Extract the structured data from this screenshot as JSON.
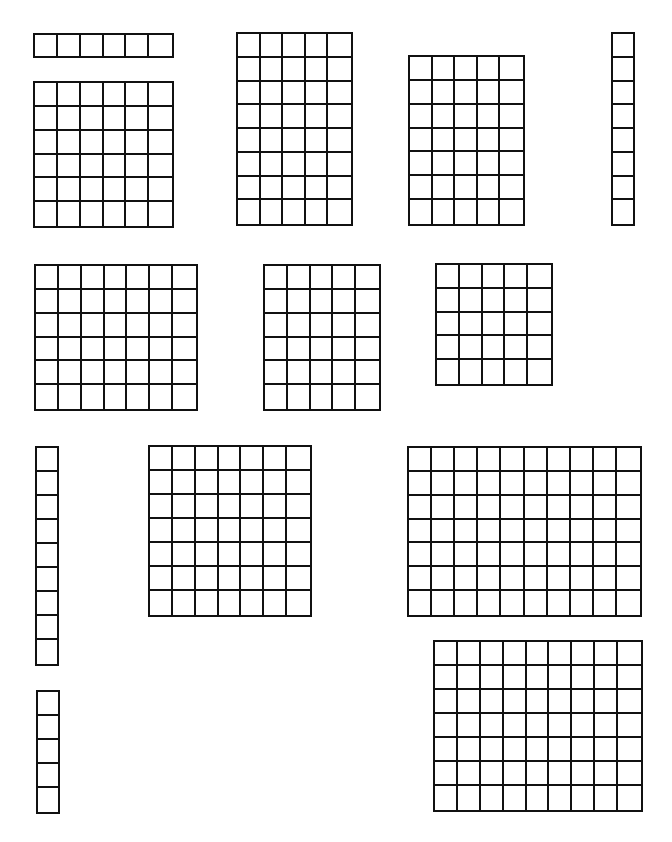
{
  "page": {
    "background": "#ffffff",
    "line_color": "#111111"
  },
  "grids": [
    {
      "id": "strip-1x6",
      "cols": 6,
      "rows": 1,
      "x": 33,
      "y": 33,
      "w": 141,
      "h": 25
    },
    {
      "id": "grid-6x6",
      "cols": 6,
      "rows": 6,
      "x": 33,
      "y": 81,
      "w": 141,
      "h": 147
    },
    {
      "id": "grid-5x8",
      "cols": 5,
      "rows": 8,
      "x": 236,
      "y": 32,
      "w": 117,
      "h": 194
    },
    {
      "id": "grid-5x7-a",
      "cols": 5,
      "rows": 7,
      "x": 408,
      "y": 55,
      "w": 117,
      "h": 171
    },
    {
      "id": "strip-8x1",
      "cols": 1,
      "rows": 8,
      "x": 611,
      "y": 32,
      "w": 24,
      "h": 194
    },
    {
      "id": "grid-7x6",
      "cols": 7,
      "rows": 6,
      "x": 34,
      "y": 264,
      "w": 164,
      "h": 147
    },
    {
      "id": "grid-5x6",
      "cols": 5,
      "rows": 6,
      "x": 263,
      "y": 264,
      "w": 118,
      "h": 147
    },
    {
      "id": "grid-5x5",
      "cols": 5,
      "rows": 5,
      "x": 435,
      "y": 263,
      "w": 118,
      "h": 123
    },
    {
      "id": "strip-9x1",
      "cols": 1,
      "rows": 9,
      "x": 35,
      "y": 446,
      "w": 24,
      "h": 220
    },
    {
      "id": "grid-7x7",
      "cols": 7,
      "rows": 7,
      "x": 148,
      "y": 445,
      "w": 164,
      "h": 172
    },
    {
      "id": "grid-10x7",
      "cols": 10,
      "rows": 7,
      "x": 407,
      "y": 446,
      "w": 235,
      "h": 171
    },
    {
      "id": "strip-5x1",
      "cols": 1,
      "rows": 5,
      "x": 36,
      "y": 690,
      "w": 24,
      "h": 124
    },
    {
      "id": "grid-9x7",
      "cols": 9,
      "rows": 7,
      "x": 433,
      "y": 640,
      "w": 210,
      "h": 172
    }
  ]
}
